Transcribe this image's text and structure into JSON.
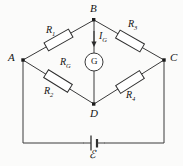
{
  "figure": {
    "type": "circuit-diagram",
    "name": "Wheatstone bridge circuit",
    "background": "#fbfbfa",
    "line_color": "#3a3a3a",
    "label_color": "#141414"
  },
  "nodes": [
    {
      "id": "B",
      "label": "B",
      "x": 94,
      "y": 20
    },
    {
      "id": "A",
      "label": "A",
      "x": 23,
      "y": 60
    },
    {
      "id": "C",
      "label": "C",
      "x": 164,
      "y": 60
    },
    {
      "id": "D",
      "label": "D",
      "x": 94,
      "y": 104
    }
  ],
  "resistors": [
    {
      "id": "R1",
      "label": "R",
      "subscript": "1",
      "branch": "A-B",
      "x": 52,
      "y": 32
    },
    {
      "id": "R3",
      "label": "R",
      "subscript": "3",
      "branch": "B-C",
      "x": 131,
      "y": 21
    },
    {
      "id": "R2",
      "label": "R",
      "subscript": "2",
      "branch": "A-D",
      "x": 45,
      "y": 88
    },
    {
      "id": "R4",
      "label": "R",
      "subscript": "4",
      "branch": "D-C",
      "x": 128,
      "y": 92
    }
  ],
  "galvanometer": {
    "symbol": "G",
    "resistance_label": "R",
    "resistance_subscript": "G",
    "current_label": "I",
    "current_subscript": "G",
    "current_direction": "down",
    "branch": "B-D",
    "cx": 94,
    "cy": 62,
    "r": 9
  },
  "source": {
    "symbol": "ℰ",
    "name": "emf-battery",
    "x": 94,
    "y": 143
  }
}
